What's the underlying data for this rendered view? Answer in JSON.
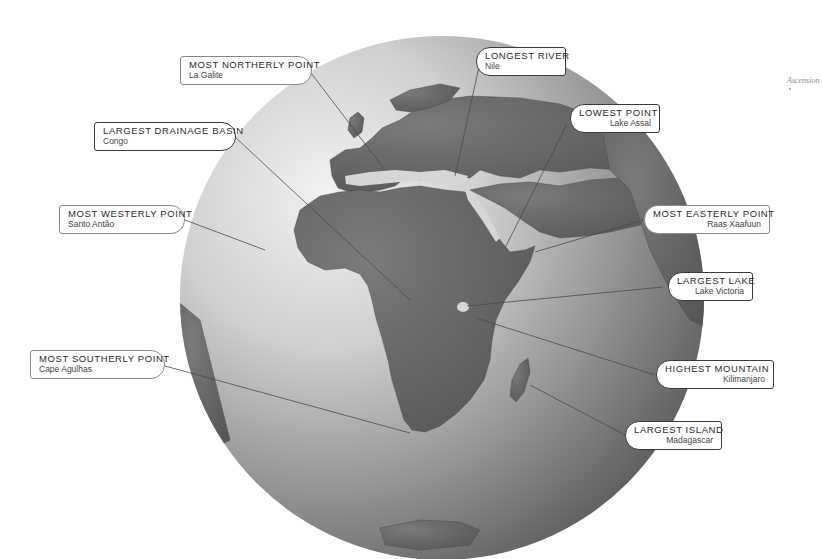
{
  "diagram": {
    "colors": {
      "land": "#6b6b6b",
      "sea_light": "#e4e4e4",
      "sea_dark": "#5a5a5a",
      "leader_line": "#4a4a4a",
      "callout_border": "#8a8a8a",
      "callout_border_strong": "#3a3a3a"
    },
    "callouts": [
      {
        "id": "most-northerly",
        "title": "MOST NORTHERLY POINT",
        "value": "La Galite"
      },
      {
        "id": "longest-river",
        "title": "LONGEST RIVER",
        "value": "Nile"
      },
      {
        "id": "lowest-point",
        "title": "LOWEST POINT",
        "value": "Lake Assal"
      },
      {
        "id": "largest-drainage-basin",
        "title": "LARGEST DRAINAGE BASIN",
        "value": "Congo"
      },
      {
        "id": "most-westerly",
        "title": "MOST WESTERLY POINT",
        "value": "Santo Antão"
      },
      {
        "id": "most-easterly",
        "title": "MOST EASTERLY POINT",
        "value": "Raas Xaafuun"
      },
      {
        "id": "largest-lake",
        "title": "LARGEST LAKE",
        "value": "Lake Victoria"
      },
      {
        "id": "most-southerly",
        "title": "MOST SOUTHERLY POINT",
        "value": "Cape Agulhas"
      },
      {
        "id": "highest-mountain",
        "title": "HIGHEST MOUNTAIN",
        "value": "Kilimanjaro"
      },
      {
        "id": "largest-island",
        "title": "LARGEST ISLAND",
        "value": "Madagascar"
      }
    ],
    "map_labels": {
      "ascension": "Ascension"
    }
  }
}
